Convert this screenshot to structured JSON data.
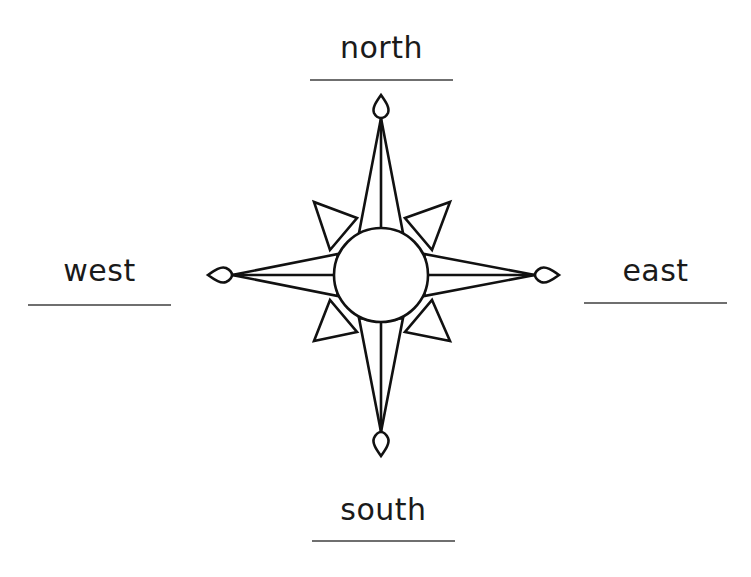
{
  "diagram": {
    "type": "compass-rose",
    "labels": {
      "north": "north",
      "south": "south",
      "east": "east",
      "west": "west"
    },
    "colors": {
      "stroke": "#111111",
      "text": "#1a1a1a",
      "rule": "#6f6f6f",
      "background": "#ffffff"
    }
  }
}
